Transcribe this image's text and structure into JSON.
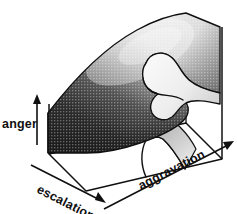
{
  "figure": {
    "background_color": "#ffffff",
    "ink_color": "#101010",
    "surface_dark_color": "#2b2b2b",
    "surface_light_color": "#f2f2f2",
    "surface_texture": "halftone-crosshatch"
  },
  "axes": {
    "vertical": {
      "label": "anger",
      "icon": "up-arrow-icon",
      "direction": "up"
    },
    "depth": {
      "label": "escalation",
      "icon": "down-right-arrow-icon",
      "direction": "down-right"
    },
    "horizontal": {
      "label": "aggravation",
      "icon": "up-right-arrow-icon",
      "direction": "up-right"
    }
  },
  "surface": {
    "name": "folded-response-surface",
    "fold_name": "cusp-fold",
    "bifurcation_curve_name": "cusp-projection"
  }
}
